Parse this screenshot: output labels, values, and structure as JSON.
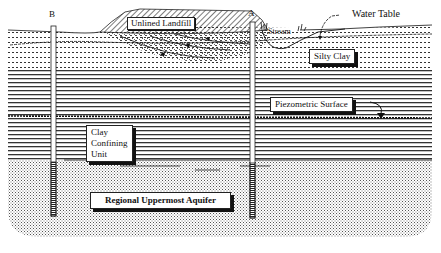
{
  "diagram": {
    "type": "geologic-cross-section",
    "wells": [
      {
        "id": "B",
        "label": "B"
      },
      {
        "id": "A",
        "label": "A"
      }
    ],
    "labels": {
      "landfill": "Unlined Landfill",
      "stream": "Stream",
      "water_table": "Water Table",
      "silty_clay": "Silty Clay",
      "piezometric_surface": "Piezometric Surface",
      "clay_confining_unit": [
        "Clay",
        "Confining",
        "Unit"
      ],
      "aquifer": "Regional Uppermost Aquifer"
    },
    "layers": [
      {
        "name": "Unlined Landfill",
        "pattern": "diagonal-hatch"
      },
      {
        "name": "Silty Clay",
        "pattern": "dotted-lines"
      },
      {
        "name": "Clay Confining Unit",
        "pattern": "horizontal-lines"
      },
      {
        "name": "Regional Uppermost Aquifer",
        "pattern": "stipple"
      }
    ],
    "colors": {
      "ink": "#111111",
      "background": "#ffffff"
    }
  }
}
